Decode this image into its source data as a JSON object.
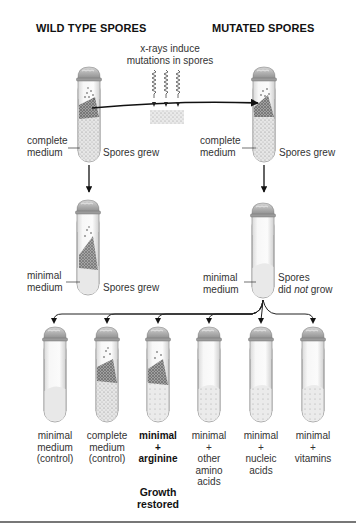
{
  "headers": {
    "wild_type": "WILD TYPE SPORES",
    "mutated": "MUTATED SPORES"
  },
  "xray_note": {
    "line1": "x-rays induce",
    "line2": "mutations in spores"
  },
  "top_row": {
    "left": {
      "medium_line1": "complete",
      "medium_line2": "medium",
      "result": "Spores grew"
    },
    "right": {
      "medium_line1": "complete",
      "medium_line2": "medium",
      "result": "Spores grew"
    }
  },
  "middle_row": {
    "left": {
      "medium_line1": "minimal",
      "medium_line2": "medium",
      "result": "Spores grew"
    },
    "right": {
      "medium_line1": "minimal",
      "medium_line2": "medium",
      "result_line1": "Spores",
      "result_line2_pre": "did ",
      "result_line2_em": "not",
      "result_line2_post": " grow"
    }
  },
  "bottom_row": [
    {
      "lines": [
        "minimal",
        "medium",
        "(control)"
      ],
      "bold": false,
      "growth": "none"
    },
    {
      "lines": [
        "complete",
        "medium",
        "(control)"
      ],
      "bold": false,
      "growth": "full"
    },
    {
      "lines": [
        "minimal",
        "+",
        "arginine"
      ],
      "bold": true,
      "growth": "full"
    },
    {
      "lines": [
        "minimal",
        "+",
        "other",
        "amino",
        "acids"
      ],
      "bold": false,
      "growth": "none"
    },
    {
      "lines": [
        "minimal",
        "+",
        "nucleic",
        "acids"
      ],
      "bold": false,
      "growth": "none"
    },
    {
      "lines": [
        "minimal",
        "+",
        "vitamins"
      ],
      "bold": false,
      "growth": "none"
    }
  ],
  "result_note": {
    "line1": "Growth",
    "line2": "restored"
  }
}
